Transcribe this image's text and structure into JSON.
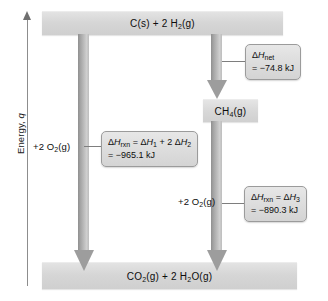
{
  "axis": {
    "label_text": "Energy,",
    "label_var": "q",
    "name": "energy-axis"
  },
  "levels": {
    "top": {
      "id": "reactants",
      "text": "C(s) + 2 H2(g)",
      "parts": [
        {
          "t": "C(s) + 2 H"
        },
        {
          "t": "2",
          "sub": true
        },
        {
          "t": "(g)"
        }
      ]
    },
    "middle": {
      "id": "methane",
      "text": "CH4(g)",
      "parts": [
        {
          "t": "CH"
        },
        {
          "t": "4",
          "sub": true
        },
        {
          "t": "(g)"
        }
      ]
    },
    "bottom": {
      "id": "products",
      "text": "CO2(g) + 2 H2O(g)",
      "parts": [
        {
          "t": "CO"
        },
        {
          "t": "2",
          "sub": true
        },
        {
          "t": "(g) + 2 H"
        },
        {
          "t": "2",
          "sub": true
        },
        {
          "t": "O(g)"
        }
      ]
    }
  },
  "reagents": {
    "left": {
      "text": "+2 O2(g)"
    },
    "right": {
      "text": "+2 O2(g)"
    }
  },
  "callouts": {
    "net": {
      "line1_symbol": "ΔH",
      "line1_sub": "net",
      "line2": "= −74.8 kJ",
      "value_kj": -74.8
    },
    "rxn_sum": {
      "line1_symbol": "ΔH",
      "line1_sub": "rxn",
      "line1_rest_a": "ΔH",
      "line1_sub_a": "1",
      "line1_rest_b": "2 ΔH",
      "line1_sub_b": "2",
      "line2": "= −965.1 kJ",
      "value_kj": -965.1
    },
    "rxn3": {
      "line1_symbol": "ΔH",
      "line1_sub": "rxn",
      "line1_rest_a": "ΔH",
      "line1_sub_a": "3",
      "line2": "= −890.3 kJ",
      "value_kj": -890.3
    }
  },
  "chart_data": {
    "type": "diagram",
    "ylabel": "Energy, q",
    "states": [
      {
        "name": "C(s) + 2 H2(g)",
        "level": "high",
        "role": "initial reactants"
      },
      {
        "name": "CH4(g)",
        "level": "intermediate",
        "role": "intermediate product"
      },
      {
        "name": "CO2(g) + 2 H2O(g)",
        "level": "low",
        "role": "final products"
      }
    ],
    "transitions": [
      {
        "from": "C(s) + 2 H2(g)",
        "to": "CH4(g)",
        "label": "ΔH_net",
        "value": -74.8,
        "unit": "kJ"
      },
      {
        "from": "C(s) + 2 H2(g)",
        "to": "CO2(g) + 2 H2O(g)",
        "label": "ΔH_rxn = ΔH_1 + 2 ΔH_2",
        "value": -965.1,
        "unit": "kJ",
        "added_reagent": "+2 O2(g)"
      },
      {
        "from": "CH4(g)",
        "to": "CO2(g) + 2 H2O(g)",
        "label": "ΔH_rxn = ΔH_3",
        "value": -890.3,
        "unit": "kJ",
        "added_reagent": "+2 O2(g)"
      }
    ]
  }
}
